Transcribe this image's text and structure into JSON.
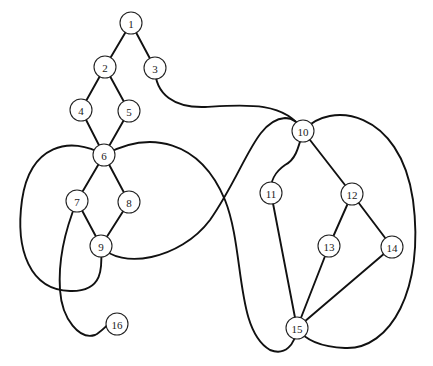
{
  "diagram": {
    "type": "graph",
    "node_radius": 11,
    "colors": {
      "stroke": "#111111",
      "node_fill": "#ffffff",
      "text": "#222222"
    },
    "nodes": [
      {
        "id": "1",
        "label": "1",
        "x": 131,
        "y": 23
      },
      {
        "id": "2",
        "label": "2",
        "x": 105,
        "y": 67
      },
      {
        "id": "3",
        "label": "3",
        "x": 155,
        "y": 68
      },
      {
        "id": "4",
        "label": "4",
        "x": 81,
        "y": 110
      },
      {
        "id": "5",
        "label": "5",
        "x": 129,
        "y": 111
      },
      {
        "id": "6",
        "label": "6",
        "x": 104,
        "y": 155
      },
      {
        "id": "7",
        "label": "7",
        "x": 77,
        "y": 201
      },
      {
        "id": "8",
        "label": "8",
        "x": 129,
        "y": 202
      },
      {
        "id": "9",
        "label": "9",
        "x": 101,
        "y": 246
      },
      {
        "id": "10",
        "label": "10",
        "x": 303,
        "y": 131
      },
      {
        "id": "11",
        "label": "11",
        "x": 271,
        "y": 193
      },
      {
        "id": "12",
        "label": "12",
        "x": 352,
        "y": 194
      },
      {
        "id": "13",
        "label": "13",
        "x": 329,
        "y": 246
      },
      {
        "id": "14",
        "label": "14",
        "x": 392,
        "y": 247
      },
      {
        "id": "15",
        "label": "15",
        "x": 297,
        "y": 328
      },
      {
        "id": "16",
        "label": "16",
        "x": 117,
        "y": 324
      }
    ],
    "edges": [
      {
        "from": "1",
        "to": "2",
        "d": "M131 23 L105 67"
      },
      {
        "from": "1",
        "to": "3",
        "d": "M131 23 L155 68"
      },
      {
        "from": "2",
        "to": "4",
        "d": "M105 67 L81 110"
      },
      {
        "from": "2",
        "to": "5",
        "d": "M105 67 L129 111"
      },
      {
        "from": "4",
        "to": "6",
        "d": "M81 110 L104 155"
      },
      {
        "from": "5",
        "to": "6",
        "d": "M129 111 L104 155"
      },
      {
        "from": "6",
        "to": "7",
        "d": "M104 155 L77 201"
      },
      {
        "from": "6",
        "to": "8",
        "d": "M104 155 L129 202"
      },
      {
        "from": "7",
        "to": "9",
        "d": "M77 201 L101 246"
      },
      {
        "from": "8",
        "to": "9",
        "d": "M129 202 L101 246"
      },
      {
        "from": "3",
        "to": "10",
        "d": "M155 68 C155 95 175 108 205 107 C240 105 285 100 303 131"
      },
      {
        "from": "6",
        "to": "9",
        "d": "M104 155 C70 135 30 145 22 200 C15 250 30 290 70 291 C105 292 102 265 101 246"
      },
      {
        "from": "6",
        "to": "15",
        "d": "M104 155 C150 130 200 140 225 200 C245 250 235 330 270 350 C285 356 295 345 297 328"
      },
      {
        "from": "9",
        "to": "10",
        "d": "M101 246 C120 270 180 260 210 220 C245 170 255 120 285 118 C295 118 300 125 303 131"
      },
      {
        "from": "7",
        "to": "16",
        "d": "M77 201 C65 230 58 260 60 290 C62 320 80 340 95 335 C105 330 110 318 117 324"
      },
      {
        "from": "10",
        "to": "11",
        "d": "M303 131 C298 150 295 160 285 165 C275 172 270 180 271 193"
      },
      {
        "from": "10",
        "to": "12",
        "d": "M303 131 L352 194"
      },
      {
        "from": "10",
        "to": "15",
        "d": "M303 131 C330 100 400 110 413 200 C425 290 390 350 345 348 C320 347 305 340 297 328"
      },
      {
        "from": "11",
        "to": "15",
        "d": "M271 193 L297 328"
      },
      {
        "from": "12",
        "to": "13",
        "d": "M352 194 L329 246"
      },
      {
        "from": "12",
        "to": "14",
        "d": "M352 194 L392 247"
      },
      {
        "from": "13",
        "to": "15",
        "d": "M329 246 L297 328"
      },
      {
        "from": "14",
        "to": "15",
        "d": "M392 247 L297 328"
      }
    ]
  }
}
